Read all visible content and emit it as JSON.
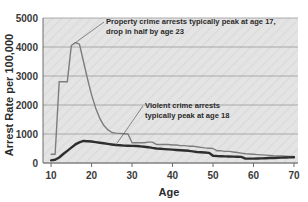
{
  "chart_data": {
    "type": "line",
    "title": "",
    "subtitle": "",
    "xlabel": "Age",
    "ylabel": "Arrest Rate per 100,000",
    "xlim": [
      8,
      71
    ],
    "ylim": [
      0,
      5000
    ],
    "grid": true,
    "grid_axis": "y",
    "legend": false,
    "legend_position": "none",
    "plot_background": "#e4e4e4",
    "x_ticks": [
      10,
      20,
      30,
      40,
      50,
      60,
      70
    ],
    "x_tick_labels": [
      "10",
      "20",
      "30",
      "40",
      "50",
      "60",
      "70"
    ],
    "y_ticks": [
      0,
      1000,
      2000,
      3000,
      4000,
      5000
    ],
    "y_tick_labels": [
      "0",
      "1000",
      "2000",
      "3000",
      "4000",
      "5000"
    ],
    "x": [
      10,
      11,
      12,
      13,
      14,
      15,
      16,
      17,
      18,
      19,
      20,
      21,
      22,
      23,
      24,
      25,
      26,
      27,
      28,
      29,
      30,
      31,
      32,
      33,
      34,
      35,
      36,
      37,
      38,
      39,
      40,
      41,
      42,
      43,
      44,
      45,
      46,
      47,
      48,
      49,
      50,
      51,
      52,
      53,
      54,
      55,
      56,
      57,
      58,
      59,
      60,
      61,
      62,
      63,
      64,
      65,
      66,
      67,
      68,
      69,
      70
    ],
    "series": [
      {
        "name": "Property crime arrests",
        "color": "#7d7d7d",
        "line_width": 1.4,
        "values": [
          300,
          300,
          2800,
          2800,
          2800,
          4050,
          4150,
          4100,
          3500,
          2900,
          2350,
          1900,
          1550,
          1300,
          1150,
          1050,
          1030,
          1020,
          1010,
          1000,
          700,
          700,
          700,
          700,
          720,
          720,
          640,
          640,
          640,
          640,
          620,
          620,
          600,
          600,
          580,
          580,
          560,
          540,
          520,
          510,
          500,
          420,
          420,
          400,
          400,
          380,
          360,
          340,
          320,
          310,
          300,
          290,
          280,
          270,
          260,
          250,
          245,
          240,
          235,
          230,
          225
        ]
      },
      {
        "name": "Violent crime arrests",
        "color": "#2e2e2e",
        "line_width": 2.4,
        "values": [
          90,
          110,
          190,
          310,
          420,
          530,
          640,
          710,
          760,
          750,
          740,
          720,
          700,
          680,
          660,
          640,
          620,
          610,
          600,
          595,
          590,
          585,
          575,
          560,
          545,
          520,
          500,
          490,
          480,
          470,
          460,
          450,
          440,
          430,
          420,
          400,
          380,
          370,
          360,
          350,
          250,
          240,
          235,
          230,
          225,
          220,
          215,
          210,
          150,
          150,
          150,
          155,
          160,
          165,
          170,
          175,
          180,
          185,
          190,
          195,
          200
        ]
      }
    ],
    "annotations": [
      {
        "id": "property-annotation",
        "line1": "Property crime arrests typically peak at age 17,",
        "line2": "drop in half by age 23",
        "points_to_series": "Property crime arrests",
        "points_to_x": 16,
        "points_to_y": 4150
      },
      {
        "id": "violent-annotation",
        "line1": "Violent crime arrests",
        "line2": "typically peak at age 18",
        "points_to_series": "Violent crime arrests",
        "points_to_x": 26,
        "points_to_y": 620
      }
    ]
  }
}
